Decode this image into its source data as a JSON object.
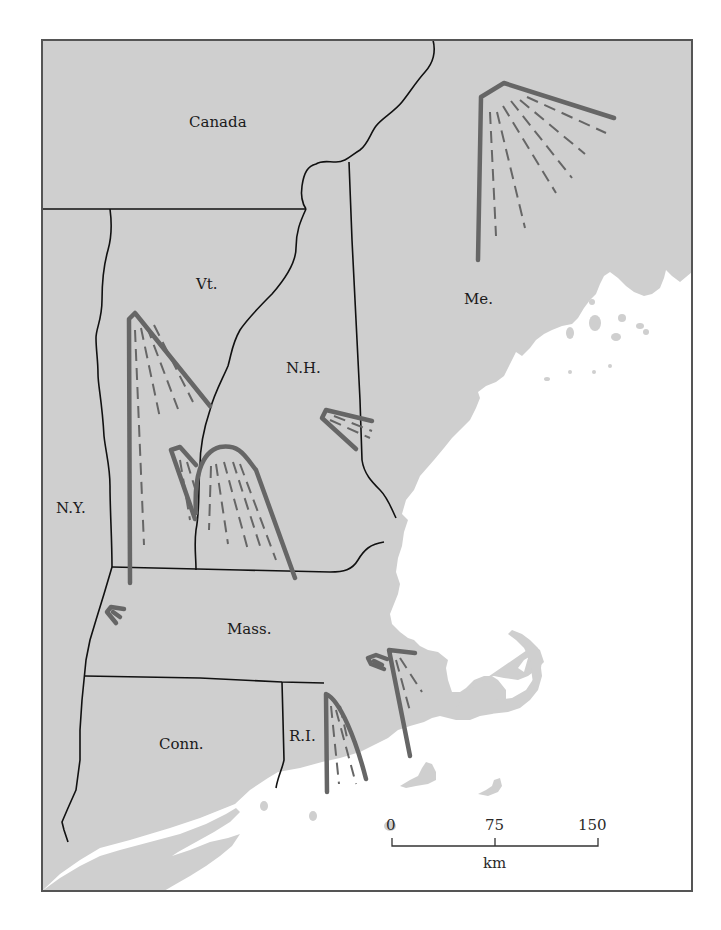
{
  "map": {
    "type": "glacial-lobe map",
    "region": "New England",
    "frame": {
      "x": 42,
      "y": 40,
      "width": 650,
      "height": 851
    },
    "colors": {
      "land": "#cfcfcf",
      "water": "#ffffff",
      "border": "#111111",
      "moraine_lobe": "#666666",
      "frame": "#555555"
    },
    "labels": [
      {
        "id": "canada",
        "text": "Canada",
        "x": 219,
        "y": 127
      },
      {
        "id": "vermont",
        "text": "Vt.",
        "x": 179,
        "y": 289
      },
      {
        "id": "new-hampshire",
        "text": "N.H.",
        "x": 302,
        "y": 373
      },
      {
        "id": "maine",
        "text": "Me.",
        "x": 480,
        "y": 304
      },
      {
        "id": "new-york",
        "text": "N.Y.",
        "x": 74,
        "y": 513
      },
      {
        "id": "massachusetts",
        "text": "Mass.",
        "x": 248,
        "y": 634
      },
      {
        "id": "connecticut",
        "text": "Conn.",
        "x": 185,
        "y": 749
      },
      {
        "id": "rhode-island",
        "text": "R.I.",
        "x": 304,
        "y": 741
      }
    ],
    "legend": {
      "scale_bar": {
        "ticks": [
          "0",
          "75",
          "150"
        ],
        "unit": "km"
      }
    }
  }
}
